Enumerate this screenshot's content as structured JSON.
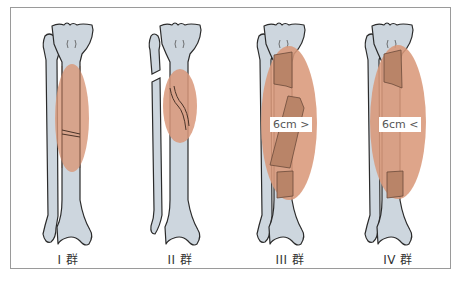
{
  "diagram": {
    "colors": {
      "bone_fill": "#cdd6de",
      "bone_outline": "#2b2b2b",
      "injury_zone": "#d9987a",
      "fragment_shade": "#b98468",
      "frame": "#9a9a9a"
    },
    "groups": [
      {
        "id": "I",
        "label": "I 群",
        "fracture": "transverse tibial fracture, fibula intact"
      },
      {
        "id": "II",
        "label": "II 群",
        "fracture": "oblique/spiral tibial fracture with fibula fracture"
      },
      {
        "id": "III",
        "label": "III 群",
        "fracture": "segmental fracture, defect",
        "length_label": "6cm >"
      },
      {
        "id": "IV",
        "label": "IV 群",
        "fracture": "bone defect",
        "length_label": "6cm <"
      }
    ]
  }
}
